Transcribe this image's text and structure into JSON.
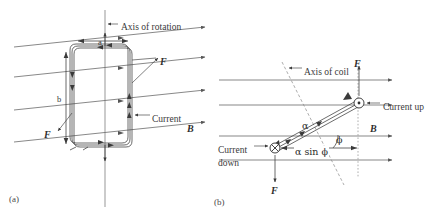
{
  "figure": {
    "type": "physics-diagram",
    "panels": [
      {
        "id": "a",
        "caption": "(a)",
        "view": "perspective view of rectangular multi-turn coil in uniform field",
        "labels": {
          "axis": "Axis of rotation",
          "side_a": "a",
          "side_b": "b",
          "force_right": "F",
          "force_left": "F",
          "current": "Current",
          "field": "B"
        },
        "field_lines": 4,
        "field_direction": "left to right, tilted upward"
      },
      {
        "id": "b",
        "caption": "(b)",
        "view": "edge-on view of coil rotated by angle phi",
        "labels": {
          "axis": "Axis of coil",
          "force_top": "F",
          "force_bottom": "F",
          "current_up": "Current up",
          "current_down_line1": "Current",
          "current_down_line2": "down",
          "length": "α",
          "projection": "α sin ϕ",
          "angle": "ϕ",
          "field": "B"
        },
        "field_lines": 4,
        "field_direction": "left to right, horizontal",
        "current_symbols": {
          "into_page": "⊗",
          "out_of_page": "⊙"
        }
      }
    ],
    "colors": {
      "background": "#ffffff",
      "line": "#3a3a3a",
      "field_line": "#555555",
      "dashed": "#8a8a8a",
      "text": "#3a3a3a"
    }
  }
}
